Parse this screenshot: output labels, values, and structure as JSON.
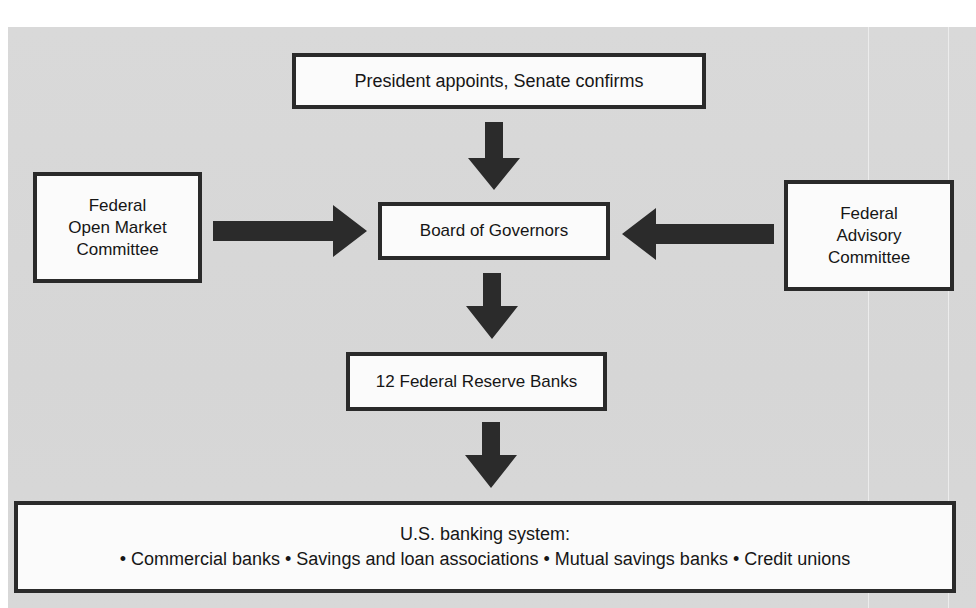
{
  "diagram": {
    "colors": {
      "background": "#d8d8d8",
      "box_fill": "#fbfbfb",
      "border": "#2a2a2a",
      "arrow": "#2b2b2b",
      "text": "#161616"
    },
    "nodes": {
      "appointment": {
        "label": "President appoints, Senate confirms"
      },
      "fomc": {
        "lines": [
          "Federal",
          "Open Market",
          "Committee"
        ]
      },
      "board": {
        "label": "Board of Governors"
      },
      "fac": {
        "lines": [
          "Federal",
          "Advisory",
          "Committee"
        ]
      },
      "reserve_banks": {
        "label": "12 Federal Reserve Banks"
      },
      "banking": {
        "title": "U.S. banking system:",
        "items_line": "• Commercial banks • Savings and loan associations • Mutual savings banks • Credit unions",
        "items": [
          "Commercial banks",
          "Savings and loan associations",
          "Mutual savings banks",
          "Credit unions"
        ]
      }
    },
    "edges": [
      {
        "from": "appointment",
        "to": "board",
        "direction": "down"
      },
      {
        "from": "fomc",
        "to": "board",
        "direction": "right"
      },
      {
        "from": "fac",
        "to": "board",
        "direction": "left"
      },
      {
        "from": "board",
        "to": "reserve_banks",
        "direction": "down"
      },
      {
        "from": "reserve_banks",
        "to": "banking",
        "direction": "down"
      }
    ]
  }
}
